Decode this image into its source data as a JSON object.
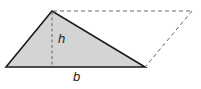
{
  "diagram": {
    "shapes": {
      "triangle": {
        "points": [
          [
            6,
            67
          ],
          [
            52,
            11
          ],
          [
            145,
            67
          ]
        ],
        "fill": "#d4d4d4",
        "stroke": "#1a1a1a"
      },
      "parallelogram_completion": {
        "points": [
          [
            52,
            11
          ],
          [
            192,
            11
          ],
          [
            145,
            67
          ]
        ],
        "stroke": "#666666",
        "style": "dashed"
      },
      "height_line": {
        "from": [
          52,
          11
        ],
        "to": [
          52,
          67
        ],
        "stroke": "#777777",
        "style": "dashed"
      }
    },
    "labels": {
      "height": "h",
      "base": "b"
    }
  }
}
